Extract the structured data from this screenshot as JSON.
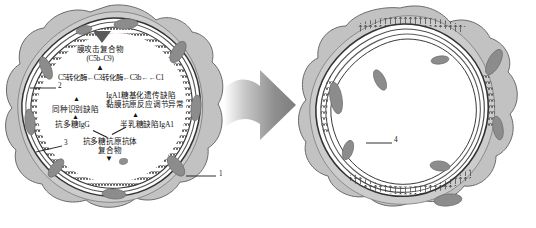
{
  "figure": {
    "kind": "medical-illustration",
    "panels": 2,
    "transition_icon": "right-arrow-icon"
  },
  "left_panel": {
    "name": "glomerular-capillary-loop-normal",
    "labels": {
      "mac_title": "膜攻击复合物",
      "mac_subtitle": "(C5b–C9)",
      "complement_chain": "C5转化酶←C3转化酶←C3b←←C1",
      "iga1_line1": "IgA1糖基化遗传缺陷",
      "iga1_line2": "黏膜抗原反应调节异常",
      "alloreco_defect": "同种识别缺陷",
      "anti_poly_igg": "抗多糖IgG",
      "gd_iga1": "半乳糖缺陷IgA1",
      "complex_line1": "抗多糖抗原抗体",
      "complex_line2": "复合物"
    },
    "callouts": [
      {
        "id": "1",
        "text": "1"
      },
      {
        "id": "2",
        "text": "2"
      },
      {
        "id": "3",
        "text": "3"
      }
    ]
  },
  "right_panel": {
    "name": "glomerular-capillary-loop-deposits",
    "callouts": [
      {
        "id": "4",
        "text": "4"
      }
    ]
  },
  "colors": {
    "cytoplasm_fill": "#b9b9b9",
    "cytoplasm_light": "#cfcfcf",
    "nucleus_fill": "#8a8a8a",
    "membrane_stroke": "#3a3a3a",
    "lumen_fill": "#ffffff",
    "arrow_gray": "#8c8c8c",
    "text_color": "#111111"
  }
}
